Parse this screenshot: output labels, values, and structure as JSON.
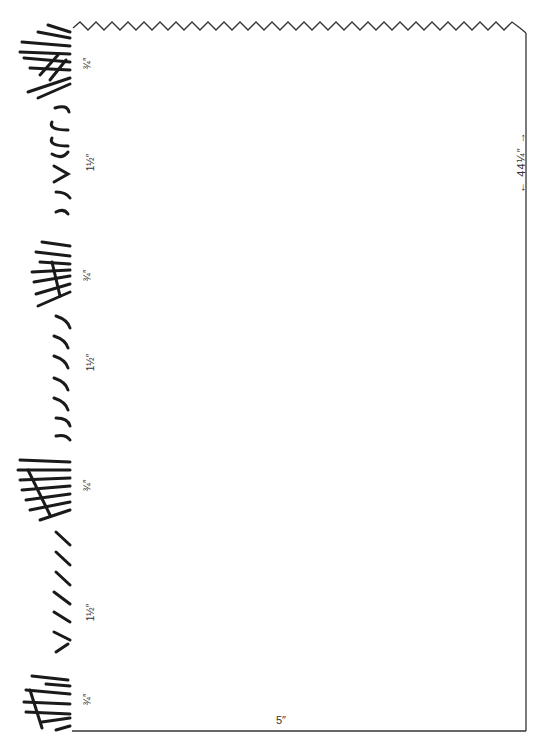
{
  "diagram": {
    "type": "pattern-piece",
    "dimensions": {
      "width_label": "5″",
      "length_label": "←  44¼″  →"
    },
    "fringe_sections": [
      {
        "label": "¾″",
        "style": "dense straight strands"
      },
      {
        "label": "1½″",
        "style": "curved strands"
      },
      {
        "label": "¾″",
        "style": "dense straight strands"
      },
      {
        "label": "1½″",
        "style": "curved strands"
      },
      {
        "label": "¾″",
        "style": "dense straight strands"
      },
      {
        "label": "1½″",
        "style": "angled strands"
      },
      {
        "label": "¾″",
        "style": "dense straight strands"
      }
    ],
    "colors": {
      "line": "#333333",
      "fringe": "#1a1a1a",
      "background": "#ffffff"
    }
  }
}
